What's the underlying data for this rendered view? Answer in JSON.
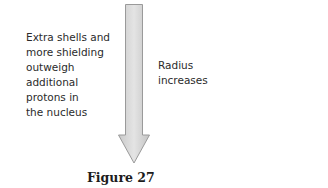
{
  "figure": {
    "left_label": [
      "Extra shells and",
      "more shielding",
      "outweigh",
      "additional",
      "protons in",
      "the nucleus"
    ],
    "right_label": [
      "Radius",
      "increases"
    ],
    "arrow": {
      "direction": "down",
      "fill": "#d3d3d3",
      "stroke": "#8a8a8a"
    },
    "caption": "Figure 27"
  }
}
